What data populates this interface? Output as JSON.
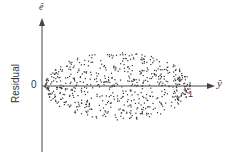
{
  "chart_data": {
    "type": "scatter",
    "title": "",
    "xlabel": "ŷ",
    "ylabel": "Residual",
    "y_axis_symbol": "ê",
    "x_ticks": [
      "1"
    ],
    "y_ticks": [
      "0"
    ],
    "xlim": [
      0,
      1.15
    ],
    "ylim": [
      -1,
      1
    ],
    "grid": false,
    "legend": null,
    "pattern": "Residuals scattered in a lens/football shape around zero; spread is small near ŷ=0 and ŷ=1 and largest near ŷ=0.5 (variance proportional to ŷ(1−ŷ))",
    "envelope": {
      "x": [
        0,
        0.1,
        0.2,
        0.3,
        0.4,
        0.5,
        0.6,
        0.7,
        0.8,
        0.9,
        1.0
      ],
      "upper": [
        0.05,
        0.5,
        0.75,
        0.9,
        0.98,
        1.0,
        0.98,
        0.9,
        0.75,
        0.5,
        0.05
      ],
      "lower": [
        -0.05,
        -0.5,
        -0.75,
        -0.9,
        -0.98,
        -1.0,
        -0.98,
        -0.9,
        -0.75,
        -0.5,
        -0.05
      ]
    }
  },
  "labels": {
    "y_axis_title": "Residual",
    "y_symbol": "ê",
    "x_symbol": "ŷ",
    "zero_tick": "0",
    "one_tick": "1"
  },
  "colors": {
    "axis": "#444444",
    "points": "#333333"
  }
}
